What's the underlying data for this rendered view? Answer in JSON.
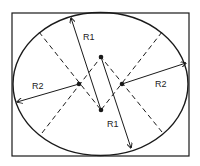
{
  "diagram": {
    "type": "ellipse-radii-construction",
    "colors": {
      "background": "#ffffff",
      "stroke": "#1a1a1a",
      "text": "#222222"
    },
    "frame": {
      "x": 12,
      "y": 13,
      "width": 177,
      "height": 143
    },
    "ellipse": {
      "cx": 100.5,
      "cy": 84,
      "rx": 87.5,
      "ry": 71.5
    },
    "centers": [
      {
        "id": "top",
        "x": 101,
        "y": 57
      },
      {
        "id": "right",
        "x": 122,
        "y": 84
      },
      {
        "id": "bottom",
        "x": 101,
        "y": 110
      },
      {
        "id": "left",
        "x": 79,
        "y": 84
      }
    ],
    "dashed_lines": [
      {
        "from": [
          39,
          32
        ],
        "to": [
          101,
          110
        ]
      },
      {
        "from": [
          162,
          32
        ],
        "to": [
          101,
          110
        ]
      },
      {
        "from": [
          42,
          133
        ],
        "to": [
          101,
          57
        ]
      },
      {
        "from": [
          162,
          132
        ],
        "to": [
          101,
          57
        ]
      }
    ],
    "radii": [
      {
        "name": "R1",
        "from": [
          101,
          110
        ],
        "to": [
          71,
          18
        ]
      },
      {
        "name": "R1",
        "from": [
          101,
          57
        ],
        "to": [
          131,
          148
        ]
      },
      {
        "name": "R2",
        "from": [
          79,
          84
        ],
        "to": [
          17,
          102
        ]
      },
      {
        "name": "R2",
        "from": [
          122,
          84
        ],
        "to": [
          186,
          63
        ]
      }
    ],
    "labels": {
      "r1_top": "R1",
      "r1_bottom": "R1",
      "r2_left": "R2",
      "r2_right": "R2"
    }
  }
}
